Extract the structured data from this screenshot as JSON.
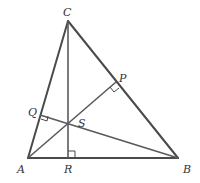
{
  "diagram": {
    "type": "triangle-altitudes",
    "colors": {
      "lines": "#4a4a4a",
      "labels": "#333333",
      "background": "#ffffff"
    },
    "points": {
      "A": {
        "label": "A",
        "x": 28,
        "y": 158
      },
      "B": {
        "label": "B",
        "x": 178,
        "y": 158
      },
      "C": {
        "label": "C",
        "x": 68,
        "y": 21
      },
      "P": {
        "label": "P",
        "x": 116,
        "y": 82
      },
      "Q": {
        "label": "Q",
        "x": 40,
        "y": 115
      },
      "R": {
        "label": "R",
        "x": 68,
        "y": 158
      },
      "S": {
        "label": "S",
        "x": 68,
        "y": 123
      }
    },
    "labels": {
      "A": "A",
      "B": "B",
      "C": "C",
      "P": "P",
      "Q": "Q",
      "R": "R",
      "S": "S"
    },
    "segments": [
      {
        "from": "A",
        "to": "B",
        "role": "side"
      },
      {
        "from": "B",
        "to": "C",
        "role": "side"
      },
      {
        "from": "C",
        "to": "A",
        "role": "side"
      },
      {
        "from": "C",
        "to": "R",
        "role": "altitude"
      },
      {
        "from": "A",
        "to": "P",
        "role": "altitude"
      },
      {
        "from": "B",
        "to": "Q",
        "role": "altitude"
      }
    ],
    "right_angle_marks": [
      "R",
      "P",
      "Q"
    ]
  }
}
